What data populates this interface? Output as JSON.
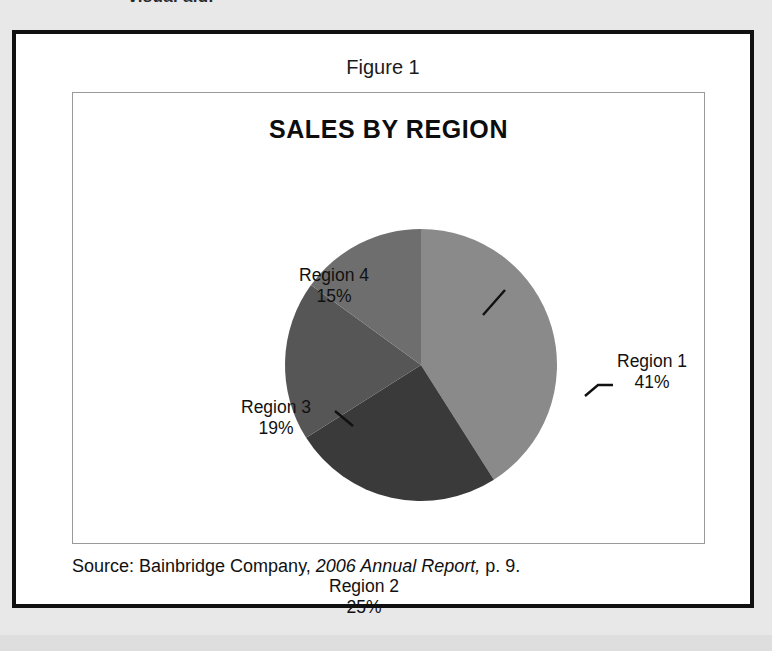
{
  "page": {
    "cutoff_heading": "visual aid."
  },
  "figure": {
    "caption": "Figure 1",
    "source": {
      "prefix": "Source:  Bainbridge Company, ",
      "italic": "2006 Annual Report,",
      "suffix": " p. 9."
    }
  },
  "chart_data": {
    "type": "pie",
    "title": "SALES BY REGION",
    "xlabel": "",
    "ylabel": "",
    "start_angle_deg": 0,
    "direction": "clockwise",
    "legend_position": "none",
    "grid": false,
    "categories": [
      "Region 1",
      "Region 2",
      "Region 3",
      "Region 4"
    ],
    "values": [
      41,
      25,
      19,
      15
    ],
    "value_unit": "%",
    "colors": [
      "#8a8a8a",
      "#3a3a3a",
      "#565656",
      "#6e6e6e"
    ],
    "slices": [
      {
        "label": "Region 1",
        "value": 41,
        "display": "41%",
        "color": "#8a8a8a"
      },
      {
        "label": "Region 2",
        "value": 25,
        "display": "25%",
        "color": "#3a3a3a"
      },
      {
        "label": "Region 3",
        "value": 19,
        "display": "19%",
        "color": "#565656"
      },
      {
        "label": "Region 4",
        "value": 15,
        "display": "15%",
        "color": "#6e6e6e"
      }
    ]
  }
}
